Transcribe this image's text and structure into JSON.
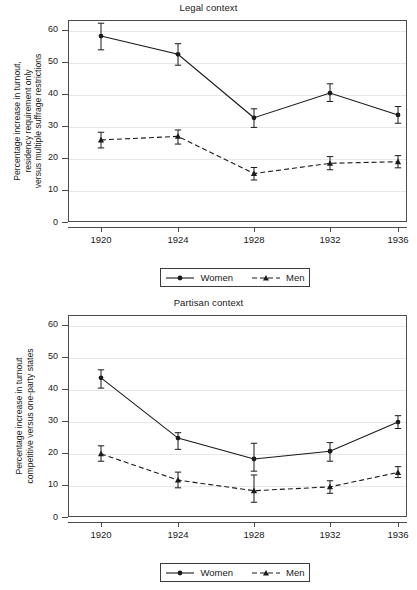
{
  "figure": {
    "width": 417,
    "height": 590,
    "background": "#ffffff",
    "line_color": "#1a1a1a",
    "grid_color": "#e8e8e8",
    "frame_color": "#4c4c4c"
  },
  "panels": [
    {
      "id": "legal",
      "title": "Legal context",
      "axis_title_lines": [
        "Percentage increase in turnout,",
        "residency requirement only",
        "versus multiple suffrage restrictions"
      ],
      "yticks": [
        0,
        10,
        20,
        30,
        40,
        50,
        60
      ],
      "xticks": [
        "1920",
        "1924",
        "1928",
        "1932",
        "1936"
      ],
      "legend": [
        {
          "label": "Women",
          "style": "solid-circle"
        },
        {
          "label": "Men",
          "style": "dashed-triangle"
        }
      ]
    },
    {
      "id": "partisan",
      "title": "Partisan context",
      "axis_title_lines": [
        "Percentage increase in turnout",
        "competitive versus one-party states"
      ],
      "yticks": [
        0,
        10,
        20,
        30,
        40,
        50,
        60
      ],
      "xticks": [
        "1920",
        "1924",
        "1928",
        "1932",
        "1936"
      ],
      "legend": [
        {
          "label": "Women",
          "style": "solid-circle"
        },
        {
          "label": "Men",
          "style": "dashed-triangle"
        }
      ]
    }
  ],
  "chart_data": [
    {
      "type": "line",
      "title": "Legal context",
      "xlabel": "",
      "ylabel": "Percentage increase in turnout, residency requirement only versus multiple suffrage restrictions",
      "categories": [
        "1920",
        "1924",
        "1928",
        "1932",
        "1936"
      ],
      "x": [
        1920,
        1924,
        1928,
        1932,
        1936
      ],
      "ylim": [
        0,
        63
      ],
      "yticks": [
        0,
        10,
        20,
        30,
        40,
        50,
        60
      ],
      "grid": "horizontal",
      "legend_position": "below",
      "error_bars": "95% confidence interval",
      "series": [
        {
          "name": "Women",
          "style": "solid-circle",
          "values": [
            58.0,
            52.3,
            32.5,
            40.2,
            33.4
          ],
          "err_low": [
            53.7,
            48.9,
            29.5,
            37.6,
            30.8
          ],
          "err_high": [
            62.0,
            55.6,
            35.3,
            43.1,
            36.0
          ]
        },
        {
          "name": "Men",
          "style": "dashed-triangle",
          "values": [
            25.6,
            26.7,
            15.1,
            18.3,
            18.8
          ],
          "err_low": [
            23.1,
            24.3,
            13.1,
            16.3,
            16.9
          ],
          "err_high": [
            28.0,
            28.7,
            17.0,
            20.4,
            20.7
          ]
        }
      ]
    },
    {
      "type": "line",
      "title": "Partisan context",
      "xlabel": "",
      "ylabel": "Percentage increase in turnout competitive versus one-party states",
      "categories": [
        "1920",
        "1924",
        "1928",
        "1932",
        "1936"
      ],
      "x": [
        1920,
        1924,
        1928,
        1932,
        1936
      ],
      "ylim": [
        0,
        63
      ],
      "yticks": [
        0,
        10,
        20,
        30,
        40,
        50,
        60
      ],
      "grid": "horizontal",
      "legend_position": "below",
      "error_bars": "95% confidence interval",
      "series": [
        {
          "name": "Women",
          "style": "solid-circle",
          "values": [
            43.4,
            24.6,
            18.1,
            20.5,
            29.6
          ],
          "err_low": [
            40.2,
            21.1,
            14.3,
            17.4,
            27.6
          ],
          "err_high": [
            45.9,
            26.3,
            23.0,
            23.2,
            31.6
          ]
        },
        {
          "name": "Men",
          "style": "dashed-triangle",
          "values": [
            19.7,
            11.5,
            8.2,
            9.4,
            13.9
          ],
          "err_low": [
            17.4,
            9.1,
            4.6,
            7.4,
            12.3
          ],
          "err_high": [
            22.2,
            14.0,
            13.1,
            11.3,
            15.7
          ]
        }
      ]
    }
  ]
}
